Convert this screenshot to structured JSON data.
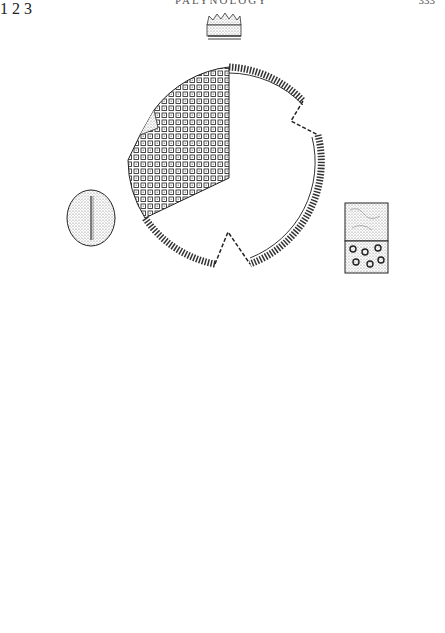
{
  "page": {
    "header_title": "PALYNOLOGY",
    "header_page_number": "333"
  },
  "figures": [
    {
      "label": "1",
      "description": "Triporate pollen grain, polar view, reticulate exine with cut-away showing wall section; inset exine profile above, small equatorial view at left, surface pattern inset at right"
    },
    {
      "label": "2",
      "description": "Large elliptic pollen grain, equatorial view, half reticulate surface and half optical section; exine profile inset above, triangular polar view at lower left, surface inset at lower right"
    },
    {
      "label": "3",
      "description": "Tricolporate pollen grain, polar view above and equatorial view below, joined by dashed guide lines; exine profile inset above, surface inset at right"
    }
  ]
}
